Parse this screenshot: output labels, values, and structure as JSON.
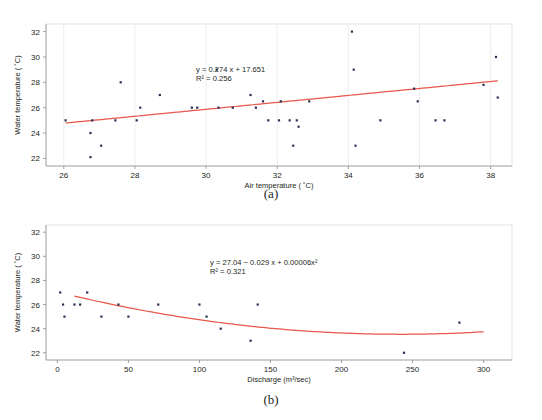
{
  "figure": {
    "caption_a": "(a)",
    "caption_b": "(b)"
  },
  "chart_data": [
    {
      "id": "a",
      "type": "scatter",
      "title": "",
      "xlabel": "Air temperature ( ˚C)",
      "ylabel": "Water temperature ( ˚C)",
      "xlim": [
        25.5,
        38.6
      ],
      "ylim": [
        21.4,
        32.6
      ],
      "xticks": [
        26,
        28,
        30,
        32,
        34,
        36,
        38
      ],
      "yticks": [
        22,
        24,
        26,
        28,
        30,
        32
      ],
      "grid": "vertical",
      "legend": "none",
      "annotation_equation": "y = 0.274 x + 17.651",
      "annotation_r2": "R² = 0.256",
      "fit_type": "linear",
      "fit_coefficients": {
        "slope": 0.274,
        "intercept": 17.651
      },
      "r_squared": 0.256,
      "points": [
        {
          "x": 26.05,
          "y": 25.0
        },
        {
          "x": 26.75,
          "y": 24.0
        },
        {
          "x": 26.75,
          "y": 22.1
        },
        {
          "x": 26.8,
          "y": 25.0
        },
        {
          "x": 27.05,
          "y": 23.0
        },
        {
          "x": 27.45,
          "y": 25.0
        },
        {
          "x": 27.6,
          "y": 28.0
        },
        {
          "x": 28.05,
          "y": 25.0
        },
        {
          "x": 28.15,
          "y": 26.0
        },
        {
          "x": 28.7,
          "y": 27.0
        },
        {
          "x": 29.6,
          "y": 26.0
        },
        {
          "x": 29.75,
          "y": 26.0
        },
        {
          "x": 30.3,
          "y": 29.0
        },
        {
          "x": 30.35,
          "y": 26.0
        },
        {
          "x": 30.75,
          "y": 26.0
        },
        {
          "x": 31.25,
          "y": 27.0
        },
        {
          "x": 31.4,
          "y": 26.0
        },
        {
          "x": 31.6,
          "y": 26.5
        },
        {
          "x": 31.75,
          "y": 25.0
        },
        {
          "x": 32.05,
          "y": 25.0
        },
        {
          "x": 32.1,
          "y": 26.5
        },
        {
          "x": 32.35,
          "y": 25.0
        },
        {
          "x": 32.45,
          "y": 23.0
        },
        {
          "x": 32.55,
          "y": 25.0
        },
        {
          "x": 32.6,
          "y": 24.5
        },
        {
          "x": 32.9,
          "y": 26.5
        },
        {
          "x": 34.1,
          "y": 32.0
        },
        {
          "x": 34.15,
          "y": 29.0
        },
        {
          "x": 34.2,
          "y": 23.0
        },
        {
          "x": 34.9,
          "y": 25.0
        },
        {
          "x": 35.85,
          "y": 27.5
        },
        {
          "x": 35.95,
          "y": 26.5
        },
        {
          "x": 36.45,
          "y": 25.0
        },
        {
          "x": 36.7,
          "y": 25.0
        },
        {
          "x": 37.8,
          "y": 27.8
        },
        {
          "x": 38.15,
          "y": 30.0
        },
        {
          "x": 38.2,
          "y": 26.8
        }
      ]
    },
    {
      "id": "b",
      "type": "scatter",
      "title": "",
      "xlabel": "Discharge (m³/sec)",
      "ylabel": "Water temperature ( ˚C)",
      "xlim": [
        -8,
        320
      ],
      "ylim": [
        21.4,
        32.6
      ],
      "xticks": [
        0,
        50,
        100,
        150,
        200,
        250,
        300
      ],
      "yticks": [
        22,
        24,
        26,
        28,
        30,
        32
      ],
      "grid": "none",
      "legend": "none",
      "annotation_equation": "y = 27.04 − 0.029 x + 0.00006x²",
      "annotation_r2": "R² = 0.321",
      "fit_type": "quadratic",
      "fit_coefficients": {
        "a": 27.04,
        "b": -0.029,
        "c": 6e-05
      },
      "r_squared": 0.321,
      "points": [
        {
          "x": 2,
          "y": 27.0
        },
        {
          "x": 4,
          "y": 26.0
        },
        {
          "x": 5,
          "y": 25.0
        },
        {
          "x": 12,
          "y": 26.0
        },
        {
          "x": 16,
          "y": 26.0
        },
        {
          "x": 21,
          "y": 27.0
        },
        {
          "x": 31,
          "y": 25.0
        },
        {
          "x": 43,
          "y": 26.0
        },
        {
          "x": 50,
          "y": 25.0
        },
        {
          "x": 71,
          "y": 26.0
        },
        {
          "x": 100,
          "y": 26.0
        },
        {
          "x": 105,
          "y": 25.0
        },
        {
          "x": 115,
          "y": 24.0
        },
        {
          "x": 136,
          "y": 23.0
        },
        {
          "x": 141,
          "y": 26.0
        },
        {
          "x": 244,
          "y": 22.0
        },
        {
          "x": 283,
          "y": 24.5
        }
      ]
    }
  ]
}
